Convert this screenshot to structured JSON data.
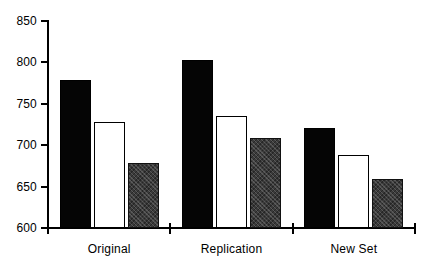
{
  "chart_data": {
    "type": "bar",
    "title": "",
    "subtitle": "",
    "xlabel": "",
    "ylabel": "",
    "categories": [
      "Original",
      "Replication",
      "New Set"
    ],
    "series": [
      {
        "name": "Series 1",
        "color": "#000000",
        "fill": "black",
        "values": [
          779,
          803,
          721
        ]
      },
      {
        "name": "Series 2",
        "color": "#ffffff",
        "fill": "white",
        "values": [
          728,
          735,
          688
        ]
      },
      {
        "name": "Series 3",
        "color": "#3a3a3a",
        "fill": "gray",
        "values": [
          679,
          709,
          659
        ]
      }
    ],
    "ylim": [
      600,
      850
    ],
    "yticks": [
      600,
      650,
      700,
      750,
      800,
      850
    ],
    "ytick_labels": [
      "600",
      "650",
      "700",
      "750",
      "800",
      "850"
    ],
    "grid": false,
    "legend": "none",
    "axis_color": "#000000",
    "background": "#ffffff"
  }
}
